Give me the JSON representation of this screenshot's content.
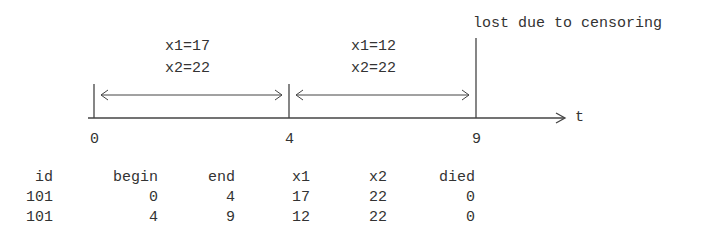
{
  "diagram": {
    "censor_label": "lost due to censoring",
    "axis_label": "t",
    "ticks": [
      "0",
      "4",
      "9"
    ],
    "intervals": [
      {
        "x1_label": "x1=17",
        "x2_label": "x2=22"
      },
      {
        "x1_label": "x1=12",
        "x2_label": "x2=22"
      }
    ]
  },
  "table": {
    "headers": [
      "id",
      "begin",
      "end",
      "x1",
      "x2",
      "died"
    ],
    "rows": [
      [
        "101",
        "0",
        "4",
        "17",
        "22",
        "0"
      ],
      [
        "101",
        "4",
        "9",
        "12",
        "22",
        "0"
      ]
    ]
  }
}
